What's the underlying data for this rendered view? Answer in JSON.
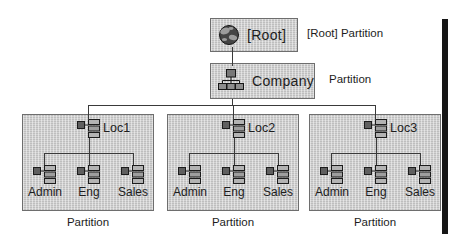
{
  "diagram": {
    "title_hint": "Directory tree partition diagram",
    "root": {
      "label": "[Root]",
      "partition": "[Root] Partition"
    },
    "company": {
      "label": "Company",
      "partition": "Partition"
    },
    "locations": [
      {
        "label": "Loc1",
        "partition": "Partition",
        "children": [
          {
            "label": "Admin"
          },
          {
            "label": "Eng"
          },
          {
            "label": "Sales"
          }
        ]
      },
      {
        "label": "Loc2",
        "partition": "Partition",
        "children": [
          {
            "label": "Admin"
          },
          {
            "label": "Eng"
          },
          {
            "label": "Sales"
          }
        ]
      },
      {
        "label": "Loc3",
        "partition": "Partition",
        "children": [
          {
            "label": "Admin"
          },
          {
            "label": "Eng"
          },
          {
            "label": "Sales"
          }
        ]
      }
    ],
    "icons": {
      "root": "globe-icon",
      "company": "org-chart-icon",
      "location": "organizational-unit-icon",
      "child": "organizational-unit-icon"
    },
    "colors": {
      "background": "#ffffff",
      "box_bg": "#d2d2d2",
      "box_border": "#6e6e6e",
      "line": "#3a3a3a",
      "edge_bar": "#161616",
      "text": "#1d1d1d"
    }
  }
}
